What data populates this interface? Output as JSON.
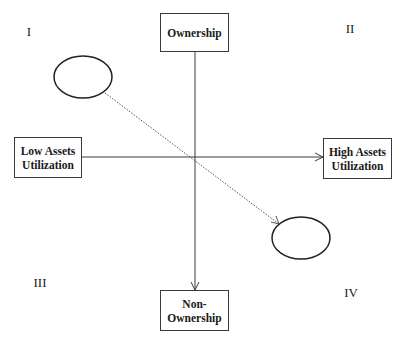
{
  "diagram": {
    "type": "quadrant-matrix",
    "nodes": {
      "top": {
        "lines": [
          "Ownership"
        ]
      },
      "bottom": {
        "lines": [
          "Non-",
          "Ownership"
        ]
      },
      "left": {
        "lines": [
          "Low Assets",
          "Utilization"
        ]
      },
      "right": {
        "lines": [
          "High Assets",
          "Utilization"
        ]
      }
    },
    "quadrants": {
      "q1": "I",
      "q2": "II",
      "q3": "III",
      "q4": "IV"
    },
    "ellipses": [
      {
        "id": "start-ellipse",
        "quadrant": "I"
      },
      {
        "id": "end-ellipse",
        "quadrant": "IV"
      }
    ],
    "edges": [
      {
        "from": "Ownership",
        "to": "Non-Ownership",
        "style": "solid",
        "arrow": "end"
      },
      {
        "from": "Low Assets Utilization",
        "to": "High Assets Utilization",
        "style": "solid",
        "arrow": "end"
      },
      {
        "from": "start-ellipse",
        "to": "end-ellipse",
        "style": "dotted",
        "arrow": "end"
      }
    ],
    "colors": {
      "stroke": "#3a3a3a",
      "text": "#1a1a1a",
      "background": "#ffffff"
    }
  }
}
